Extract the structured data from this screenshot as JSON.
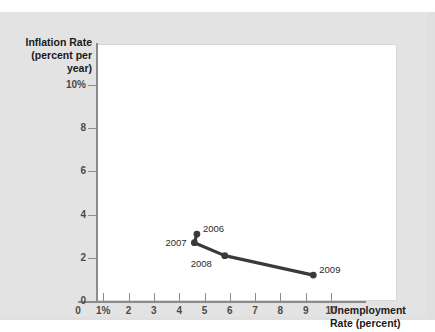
{
  "chart_data": {
    "type": "line",
    "title": "",
    "xlabel": "Unemployment Rate (percent)",
    "ylabel": "Inflation Rate (percent per year)",
    "xlim": [
      0,
      11
    ],
    "ylim": [
      0,
      11
    ],
    "grid": false,
    "legend": "none",
    "x_ticks": [
      "0",
      "1%",
      "2",
      "3",
      "4",
      "5",
      "6",
      "7",
      "8",
      "9",
      "10"
    ],
    "x_tick_values": [
      0,
      1,
      2,
      3,
      4,
      5,
      6,
      7,
      8,
      9,
      10
    ],
    "y_ticks": [
      "0",
      "2",
      "4",
      "6",
      "8",
      "10%"
    ],
    "y_tick_values": [
      0,
      2,
      4,
      6,
      8,
      10
    ],
    "series": [
      {
        "name": "Phillips curve",
        "color": "#3a3a3a",
        "points": [
          {
            "label": "2006",
            "x": 4.7,
            "y": 3.1,
            "label_pos": "right"
          },
          {
            "label": "2007",
            "x": 4.6,
            "y": 2.7,
            "label_pos": "left"
          },
          {
            "label": "2008",
            "x": 5.8,
            "y": 2.1,
            "label_pos": "below-left"
          },
          {
            "label": "2009",
            "x": 9.3,
            "y": 1.2,
            "label_pos": "right"
          }
        ]
      }
    ]
  },
  "axes": {
    "y_title_line1": "Inflation Rate",
    "y_title_line2": "(percent per year)",
    "x_title_line1": "Unemployment",
    "x_title_line2": "Rate (percent)"
  },
  "colors": {
    "figure_background": "#e3e3e3",
    "plot_background": "#ffffff",
    "axis": "#8c8c8c",
    "series": "#3a3a3a",
    "tick_text": "#4a4a4a",
    "title_text": "#1a1a1a"
  }
}
